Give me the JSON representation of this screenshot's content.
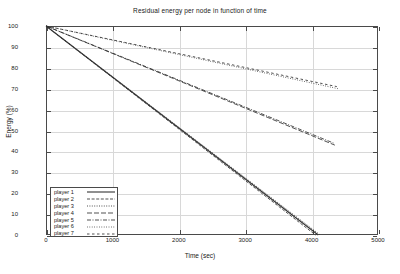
{
  "chart_data": {
    "type": "line",
    "title": "Residual energy per node in function of time",
    "xlabel": "Time (sec)",
    "ylabel": "Energy (%)",
    "xlim": [
      0,
      5000
    ],
    "ylim": [
      0,
      100
    ],
    "xticks": [
      0,
      1000,
      2000,
      3000,
      4000,
      5000
    ],
    "yticks": [
      0,
      10,
      20,
      30,
      40,
      50,
      60,
      70,
      80,
      90,
      100
    ],
    "grid": true,
    "legend_position": "lower-left",
    "series": [
      {
        "name": "player 1",
        "dash": "solid",
        "x": [
          0,
          4100
        ],
        "y": [
          100,
          0
        ]
      },
      {
        "name": "player 2",
        "dash": "dashed",
        "x": [
          0,
          4060
        ],
        "y": [
          100,
          0
        ]
      },
      {
        "name": "player 3",
        "dash": "dotted",
        "x": [
          0,
          4130
        ],
        "y": [
          100,
          0
        ]
      },
      {
        "name": "player 4",
        "dash": "long-dash",
        "x": [
          0,
          4350
        ],
        "y": [
          100,
          43
        ]
      },
      {
        "name": "player 5",
        "dash": "dash-dot",
        "x": [
          0,
          4330
        ],
        "y": [
          100,
          44
        ]
      },
      {
        "name": "player 6",
        "dash": "fine-dotted",
        "x": [
          0,
          4400
        ],
        "y": [
          100,
          70
        ]
      },
      {
        "name": "player 7",
        "dash": "sparse-dash",
        "x": [
          0,
          4380
        ],
        "y": [
          100,
          71
        ]
      }
    ]
  },
  "legend": {
    "items": [
      {
        "label": "player 1"
      },
      {
        "label": "player 2"
      },
      {
        "label": "player 3"
      },
      {
        "label": "player 4"
      },
      {
        "label": "player 5"
      },
      {
        "label": "player 6"
      },
      {
        "label": "player 7"
      }
    ]
  },
  "axis": {
    "x_tick_labels": [
      "0",
      "1000",
      "2000",
      "3000",
      "4000",
      "5000"
    ],
    "y_tick_labels": [
      "0",
      "10",
      "20",
      "30",
      "40",
      "50",
      "60",
      "70",
      "80",
      "90",
      "100"
    ]
  },
  "colors": {
    "frame": "#4a4a4a",
    "grid": "#d8d8d8",
    "line": "#333333",
    "background": "#ffffff"
  }
}
